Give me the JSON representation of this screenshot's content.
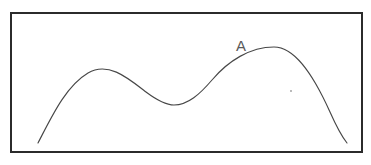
{
  "figure": {
    "background_color": "#ffffff",
    "frame": {
      "name": "plot-border",
      "x": 11,
      "y": 13,
      "width": 351,
      "height": 139,
      "stroke_color": "#2b2b2b",
      "stroke_width": 2,
      "fill_color": "#ffffff"
    },
    "curve": {
      "name": "bimodal-curve",
      "stroke_color": "#474747",
      "stroke_width": 1.15,
      "path": "M 38,143 C 52,116 66,86 88,73 C 108,61 128,78 146,92 C 158,101 166,105 174,105 C 188,105 200,94 212,80 C 228,61 250,47 274,47 C 294,47 312,72 330,112 C 338,130 343,138 347,143"
    },
    "label": {
      "name": "curve-label-a",
      "text": "A",
      "x": 236,
      "y": 51,
      "color": "#5a5a5a",
      "font_size": 15
    },
    "speck": {
      "name": "ink-speck",
      "x": 291,
      "y": 91,
      "radius": 0.9,
      "color": "#9a9a9a"
    }
  },
  "chart_data": {
    "type": "line",
    "title": "",
    "xlabel": "",
    "ylabel": "",
    "grid": false,
    "legend": "none",
    "annotations": [
      {
        "text": "A",
        "x": 236,
        "y": 51,
        "describes": "point on the rising flank just left of the right (higher) peak"
      }
    ],
    "features": [
      {
        "name": "left-end",
        "x": 38,
        "y": 143
      },
      {
        "name": "left-peak",
        "x": 88,
        "y": 73
      },
      {
        "name": "valley",
        "x": 174,
        "y": 105
      },
      {
        "name": "right-peak",
        "x": 274,
        "y": 47
      },
      {
        "name": "right-end",
        "x": 347,
        "y": 143
      }
    ],
    "x": [
      38,
      60,
      88,
      120,
      150,
      174,
      200,
      230,
      255,
      274,
      300,
      325,
      347
    ],
    "y": [
      143,
      97,
      73,
      80,
      96,
      105,
      94,
      69,
      52,
      47,
      63,
      103,
      143
    ],
    "note": "y values are screen pixel coordinates (smaller y = higher on the chart); curve has two maxima with the right peak higher than the left"
  }
}
